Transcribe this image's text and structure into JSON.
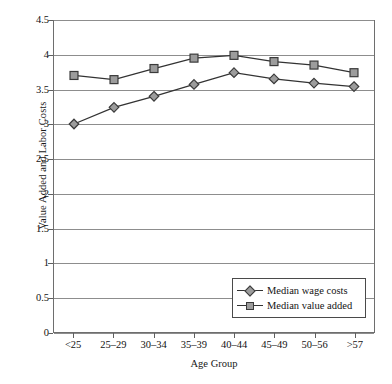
{
  "chart_data": {
    "type": "line",
    "title": "",
    "xlabel": "Age Group",
    "ylabel": "Value Added and Labor Costs",
    "categories": [
      "<25",
      "25–29",
      "30–34",
      "35–39",
      "40–44",
      "45–49",
      "50–56",
      ">57"
    ],
    "series": [
      {
        "name": "Median wage costs",
        "marker": "diamond",
        "values": [
          3.0,
          3.24,
          3.4,
          3.57,
          3.74,
          3.65,
          3.59,
          3.54
        ]
      },
      {
        "name": "Median value added",
        "marker": "square",
        "values": [
          3.7,
          3.64,
          3.8,
          3.95,
          3.99,
          3.9,
          3.85,
          3.74
        ]
      }
    ],
    "ylim": [
      0,
      4.5
    ],
    "ytick_labels": [
      "0",
      "0.5",
      "1",
      "1.5",
      "2",
      "2.5",
      "3",
      "3.5",
      "4",
      "4.5"
    ],
    "ytick_values": [
      0,
      0.5,
      1,
      1.5,
      2,
      2.5,
      3,
      3.5,
      4,
      4.5
    ],
    "grid": true,
    "legend_position": "bottom-right-inside",
    "colors": {
      "line": "#333333",
      "marker_fill": "#9c9c9c",
      "marker_stroke": "#3a3a3a",
      "gridline": "#8d8d8d",
      "axis": "#6e6e6e",
      "text": "#141414",
      "background": "#ffffff"
    }
  }
}
